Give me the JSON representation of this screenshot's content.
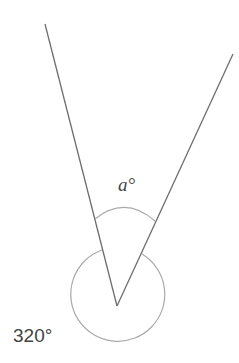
{
  "diagram": {
    "type": "angle-diagram",
    "labels": {
      "inner_angle": "a°",
      "reflex_angle": "320°"
    },
    "colors": {
      "line": "#6e6e6e",
      "arc": "#aaaaaa",
      "text": "#444444"
    }
  }
}
